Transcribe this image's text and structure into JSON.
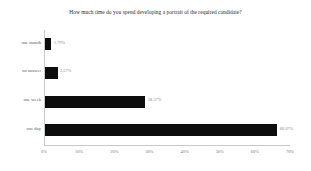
{
  "chart_data": {
    "type": "bar",
    "orientation": "horizontal",
    "title": "How much time do you spend developing a portrait of the required candidate?",
    "xlabel": "",
    "ylabel": "",
    "xlim": [
      0,
      70
    ],
    "grid": false,
    "legend": null,
    "bar_color": "#0d0d0d",
    "axis_color": "#c9c9c9",
    "label_color": "#5a5a5a",
    "value_label_color": "#8a8a8a",
    "categories": [
      "one month",
      "no answer",
      "one week",
      "one day"
    ],
    "values": [
      1.79,
      3.57,
      28.57,
      66.07
    ],
    "value_labels": [
      "1.79%",
      "3.57%",
      "28.57%",
      "66.07%"
    ],
    "xticks": [
      0,
      10,
      20,
      30,
      40,
      50,
      60,
      70
    ],
    "xtick_labels": [
      "0%",
      "10%",
      "20%",
      "30%",
      "40%",
      "50%",
      "60%",
      "70%"
    ]
  }
}
